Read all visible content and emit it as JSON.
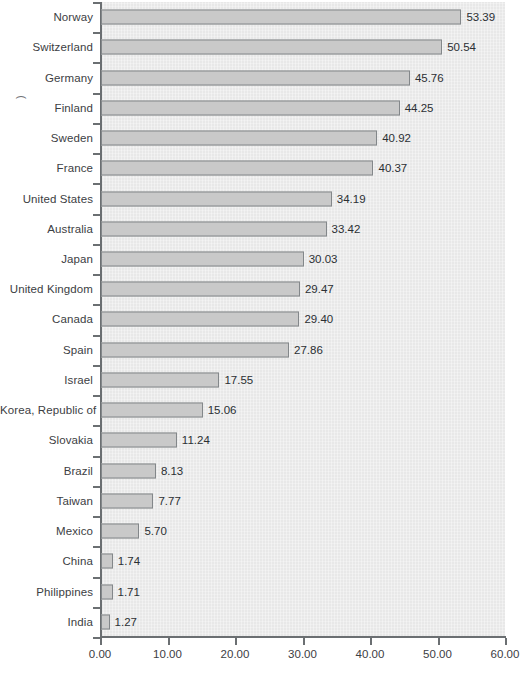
{
  "chart_data": {
    "type": "bar",
    "orientation": "horizontal",
    "title": "",
    "subtitle": "",
    "xlabel": "",
    "ylabel": "",
    "xlim": [
      0,
      60
    ],
    "xticks": [
      "0.00",
      "10.00",
      "20.00",
      "30.00",
      "40.00",
      "50.00",
      "60.00"
    ],
    "xtick_values": [
      0,
      10,
      20,
      30,
      40,
      50,
      60
    ],
    "grid": false,
    "legend": null,
    "categories": [
      "Norway",
      "Switzerland",
      "Germany",
      "Finland",
      "Sweden",
      "France",
      "United States",
      "Australia",
      "Japan",
      "United Kingdom",
      "Canada",
      "Spain",
      "Israel",
      "Korea, Republic of",
      "Slovakia",
      "Brazil",
      "Taiwan",
      "Mexico",
      "China",
      "Philippines",
      "India"
    ],
    "values": [
      53.39,
      50.54,
      45.76,
      44.25,
      40.92,
      40.37,
      34.19,
      33.42,
      30.03,
      29.47,
      29.4,
      27.86,
      17.55,
      15.06,
      11.24,
      8.13,
      7.77,
      5.7,
      1.74,
      1.71,
      1.27
    ],
    "value_labels": [
      "53.39",
      "50.54",
      "45.76",
      "44.25",
      "40.92",
      "40.37",
      "34.19",
      "33.42",
      "30.03",
      "29.47",
      "29.40",
      "27.86",
      "17.55",
      "15.06",
      "11.24",
      "8.13",
      "7.77",
      "5.70",
      "1.74",
      "1.71",
      "1.27"
    ],
    "colors": {
      "bar_fill": "#c9c9c9",
      "bar_border": "#83878a",
      "plot_background": "#e8e8e8",
      "axis": "#6b6f72",
      "text": "#3c4043"
    }
  },
  "axis_title_fragment": ")"
}
